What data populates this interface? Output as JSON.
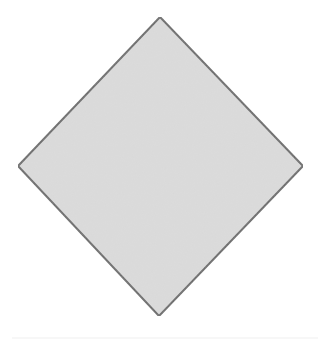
{
  "diagram": {
    "shape": "diamond",
    "vertices": {
      "top": [
        160,
        17
      ],
      "right": [
        303,
        166
      ],
      "bottom": [
        159,
        316
      ],
      "left": [
        18,
        166
      ]
    },
    "fill_color": "#d9d9d9",
    "stroke_color": "#666666",
    "stroke_width": 2,
    "background_color": "#ffffff"
  }
}
